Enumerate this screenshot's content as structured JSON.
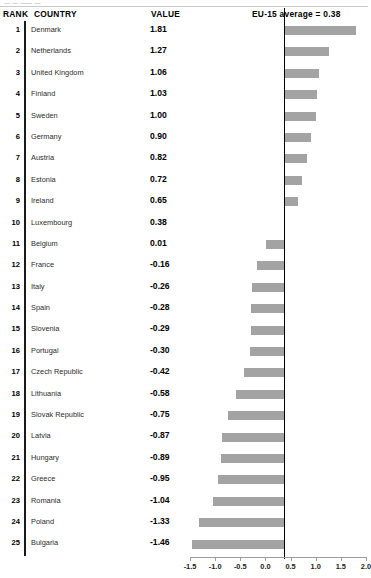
{
  "top_sliver_text": "— — —— —",
  "header": {
    "rank": "RANK",
    "country": "COUNTRY",
    "value": "VALUE",
    "eu_average": "EU-15 average = 0.38"
  },
  "colors": {
    "bar": "#a3a3a3",
    "zero_line": "#000000",
    "rank_rule": "#1a1a1a",
    "axis": "#9d9d9d",
    "background": "#ffffff"
  },
  "chart_data": {
    "type": "bar",
    "orientation": "horizontal",
    "title": "",
    "xlabel": "",
    "ylabel": "",
    "xlim": [
      -1.5,
      2.0
    ],
    "xticks": [
      -1.5,
      -1.0,
      -0.5,
      0.0,
      0.5,
      1.0,
      1.5,
      2.0
    ],
    "xticklabels": [
      "-1.5",
      "-1.0",
      "-0.5",
      "0.0",
      "0.5",
      "1.0",
      "1.5",
      "2.0"
    ],
    "grid": false,
    "legend": "none",
    "baseline": 0.38,
    "baseline_label": "EU-15 average = 0.38",
    "categories": [
      "Denmark",
      "Netherlands",
      "United Kingdom",
      "Finland",
      "Sweden",
      "Germany",
      "Austria",
      "Estonia",
      "Ireland",
      "Luxembourg",
      "Belgium",
      "France",
      "Italy",
      "Spain",
      "Slovenia",
      "Portugal",
      "Czech Republic",
      "Lithuania",
      "Slovak Republic",
      "Latvia",
      "Hungary",
      "Greece",
      "Romania",
      "Poland",
      "Bulgaria"
    ],
    "values": [
      1.81,
      1.27,
      1.06,
      1.03,
      1.0,
      0.9,
      0.82,
      0.72,
      0.65,
      0.38,
      0.01,
      -0.16,
      -0.26,
      -0.28,
      -0.29,
      -0.3,
      -0.42,
      -0.58,
      -0.75,
      -0.87,
      -0.89,
      -0.95,
      -1.04,
      -1.33,
      -1.46
    ]
  },
  "rows": [
    {
      "rank": "1",
      "country": "Denmark",
      "value": "1.81",
      "v": 1.81
    },
    {
      "rank": "2",
      "country": "Netherlands",
      "value": "1.27",
      "v": 1.27
    },
    {
      "rank": "3",
      "country": "United Kingdom",
      "value": "1.06",
      "v": 1.06
    },
    {
      "rank": "4",
      "country": "Finland",
      "value": "1.03",
      "v": 1.03
    },
    {
      "rank": "5",
      "country": "Sweden",
      "value": "1.00",
      "v": 1.0
    },
    {
      "rank": "6",
      "country": "Germany",
      "value": "0.90",
      "v": 0.9
    },
    {
      "rank": "7",
      "country": "Austria",
      "value": "0.82",
      "v": 0.82
    },
    {
      "rank": "8",
      "country": "Estonia",
      "value": "0.72",
      "v": 0.72
    },
    {
      "rank": "9",
      "country": "Ireland",
      "value": "0.65",
      "v": 0.65
    },
    {
      "rank": "10",
      "country": "Luxembourg",
      "value": "0.38",
      "v": 0.38
    },
    {
      "rank": "11",
      "country": "Belgium",
      "value": "0.01",
      "v": 0.01
    },
    {
      "rank": "12",
      "country": "France",
      "value": "-0.16",
      "v": -0.16
    },
    {
      "rank": "13",
      "country": "Italy",
      "value": "-0.26",
      "v": -0.26
    },
    {
      "rank": "14",
      "country": "Spain",
      "value": "-0.28",
      "v": -0.28
    },
    {
      "rank": "15",
      "country": "Slovenia",
      "value": "-0.29",
      "v": -0.29
    },
    {
      "rank": "16",
      "country": "Portugal",
      "value": "-0.30",
      "v": -0.3
    },
    {
      "rank": "17",
      "country": "Czech Republic",
      "value": "-0.42",
      "v": -0.42
    },
    {
      "rank": "18",
      "country": "Lithuania",
      "value": "-0.58",
      "v": -0.58
    },
    {
      "rank": "19",
      "country": "Slovak Republic",
      "value": "-0.75",
      "v": -0.75
    },
    {
      "rank": "20",
      "country": "Latvia",
      "value": "-0.87",
      "v": -0.87
    },
    {
      "rank": "21",
      "country": "Hungary",
      "value": "-0.89",
      "v": -0.89
    },
    {
      "rank": "22",
      "country": "Greece",
      "value": "-0.95",
      "v": -0.95
    },
    {
      "rank": "23",
      "country": "Romania",
      "value": "-1.04",
      "v": -1.04
    },
    {
      "rank": "24",
      "country": "Poland",
      "value": "-1.33",
      "v": -1.33
    },
    {
      "rank": "25",
      "country": "Bulgaria",
      "value": "-1.46",
      "v": -1.46
    }
  ]
}
